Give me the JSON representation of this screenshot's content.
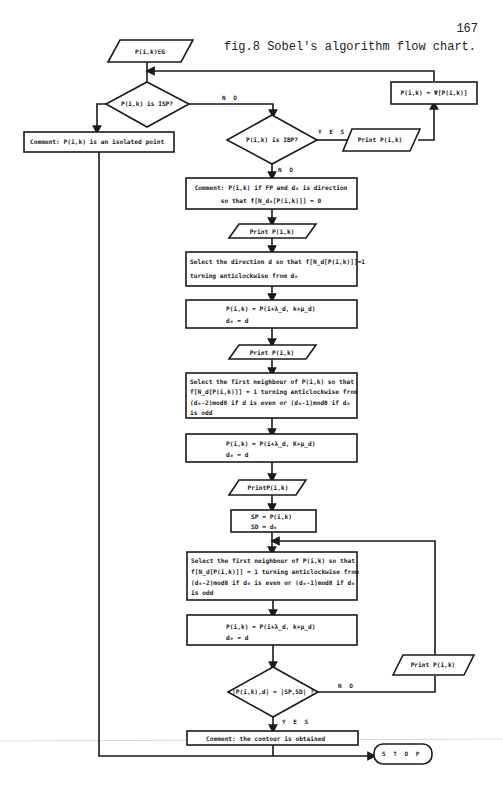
{
  "header": {
    "page_number": "167",
    "caption": "fig.8 Sobel's algorithm flow chart."
  },
  "nodes": {
    "start": "P(i,k)∈G",
    "isp_decision": "P(i,k) is ISP?",
    "isolated_comment": "Comment: P(i,k) is an isolated point",
    "ibp_decision": "P(i,k) is IBP?",
    "print_ibp": "Print P(i,k)",
    "assign_psi": "P(i,k) = Ψ[P(i,k)]",
    "fp_comment": {
      "line1": "Comment: P(i,k) if FP and d₀ is direction",
      "line2": "so that f[N_d₀[P(i,k)]] = 0"
    },
    "print_1": "Print P(i,k)",
    "select_direction": {
      "line1": "Select the direction d so that f[N_d[P(i,k)]]=1",
      "line2": "turning anticlockwise from d₀"
    },
    "move_1": {
      "line1": "P(i,k) = P(i+λ_d, k+μ_d)",
      "line2": "d₀ = d"
    },
    "print_2": "Print P(i,k)",
    "select_neighbour_1": {
      "line1": "Select the first neighbour of P(i,k) so that",
      "line2": "f[N_d[P(i,k)]] = 1 turning anticlockwise from",
      "line3": "(d₀-2)mod8 if d  is even or (d₀-1)mod8 if d₀",
      "line4": "is odd"
    },
    "move_2": {
      "line1": "P(i,k) = P(i+λ_d, K+μ_d)",
      "line2": "d₀ = d"
    },
    "print_3": "PrintP(i,k)",
    "save_start": {
      "line1": "SP = P(i,k)",
      "line2": "SD = d₀"
    },
    "select_neighbour_2": {
      "line1": "Select the first neighbour of P(i,k) so that",
      "line2": "f[N_d[P(i,k)]] = 1 turning anticlockwise from",
      "line3": "(d₀-2)mod8 if d₀ is even or (d₀-1)mod8 if d₀",
      "line4": "is odd"
    },
    "move_3": {
      "line1": "P(i,k) = P(i+λ_d, k+μ_d)",
      "line2": "d₀ = d"
    },
    "contour_decision": "|P(i,k),d| = |SP,SD| ?",
    "print_loop": "Print P(i,k)",
    "contour_comment": "Comment: the contour is obtained",
    "stop": "S T O P"
  },
  "edge_labels": {
    "isp_no": "N O",
    "ibp_yes": "Y E S",
    "ibp_no": "N O",
    "contour_no": "N O",
    "contour_yes": "Y E S"
  }
}
